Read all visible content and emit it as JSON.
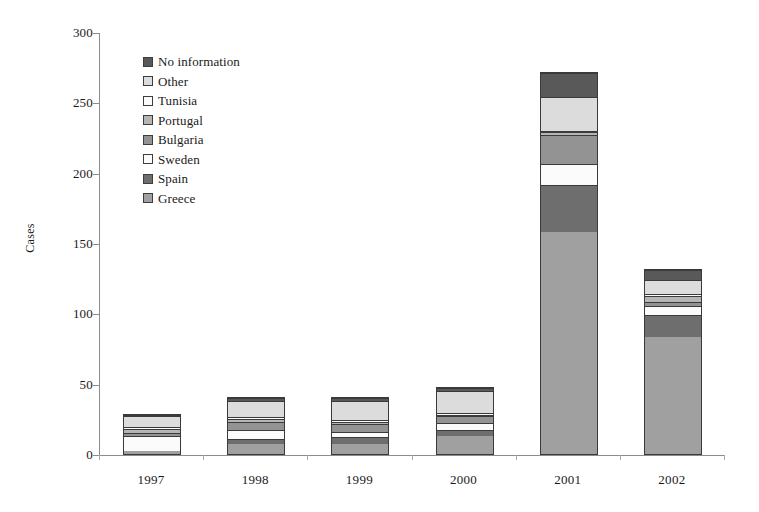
{
  "chart_data": {
    "type": "bar",
    "subtype": "stacked-vertical",
    "title": "",
    "xlabel": "",
    "ylabel": "Cases",
    "ylim": [
      0,
      300
    ],
    "ytick_step": 50,
    "yticks": [
      0,
      50,
      100,
      150,
      200,
      250,
      300
    ],
    "ytick_labels": [
      "0",
      "50",
      "100",
      "150",
      "200",
      "250",
      "300"
    ],
    "grid": false,
    "legend_position": "upper-left-inside",
    "stack_order_bottom_to_top": [
      "Greece",
      "Spain",
      "Sweden",
      "Bulgaria",
      "Portugal",
      "Tunisia",
      "Other",
      "No information"
    ],
    "categories": [
      "1997",
      "1998",
      "1999",
      "2000",
      "2001",
      "2002"
    ],
    "series": [
      {
        "name": "Greece",
        "color": "#a0a0a0",
        "values": [
          2,
          7,
          7,
          13,
          158,
          83
        ]
      },
      {
        "name": "Spain",
        "color": "#6e6e6e",
        "values": [
          0,
          4,
          5,
          4,
          33,
          16
        ]
      },
      {
        "name": "Sweden",
        "color": "#fbfbfb",
        "values": [
          11,
          6,
          4,
          5,
          15,
          6
        ]
      },
      {
        "name": "Bulgaria",
        "color": "#939393",
        "values": [
          2,
          6,
          5,
          5,
          21,
          3
        ]
      },
      {
        "name": "Portugal",
        "color": "#b5b5b5",
        "values": [
          3,
          2,
          2,
          1,
          2,
          4
        ]
      },
      {
        "name": "Tunisia",
        "color": "#fbfbfb",
        "values": [
          1,
          1,
          1,
          1,
          1,
          2
        ]
      },
      {
        "name": "Other",
        "color": "#dcdcdc",
        "values": [
          8,
          12,
          14,
          16,
          24,
          10
        ]
      },
      {
        "name": "No information",
        "color": "#595959",
        "values": [
          1,
          2,
          2,
          2,
          17,
          7
        ]
      }
    ],
    "totals": [
      28,
      40,
      40,
      47,
      271,
      131
    ]
  },
  "legend": {
    "items": [
      {
        "label": "No information",
        "color": "#595959"
      },
      {
        "label": "Other",
        "color": "#dcdcdc"
      },
      {
        "label": "Tunisia",
        "color": "#fbfbfb"
      },
      {
        "label": "Portugal",
        "color": "#b5b5b5"
      },
      {
        "label": "Bulgaria",
        "color": "#939393"
      },
      {
        "label": "Sweden",
        "color": "#fbfbfb"
      },
      {
        "label": "Spain",
        "color": "#6e6e6e"
      },
      {
        "label": "Greece",
        "color": "#a0a0a0"
      }
    ]
  },
  "axis": {
    "y_title": "Cases",
    "y_labels": [
      "300",
      "250",
      "200",
      "150",
      "100",
      "50",
      "0"
    ],
    "x_labels": [
      "1997",
      "1998",
      "1999",
      "2000",
      "2001",
      "2002"
    ]
  },
  "style": {
    "bar_outline": "#3a3a3a",
    "axis_color": "#8c8c8c",
    "background": "#ffffff"
  }
}
